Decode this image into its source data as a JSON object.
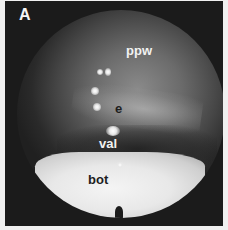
{
  "figure": {
    "panel_letter": "A",
    "labels": {
      "ppw": "ppw",
      "e": "e",
      "val": "val",
      "bot": "bot"
    },
    "colors": {
      "background": "#1b1b1b",
      "border": "#f0f0f0",
      "light_text": "#f2f2f2",
      "dark_text": "#1e1e1e"
    }
  }
}
